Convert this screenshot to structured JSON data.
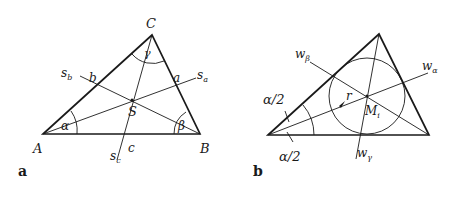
{
  "figure": {
    "panel_a": {
      "label": "a",
      "vertices": {
        "A": "A",
        "B": "B",
        "C": "C"
      },
      "sides": {
        "a": "a",
        "b": "b",
        "c": "c"
      },
      "angles": {
        "alpha": "α",
        "beta": "β",
        "gamma": "γ"
      },
      "medians": {
        "sa": "s",
        "sa_sub": "a",
        "sb": "s",
        "sb_sub": "b",
        "sc": "s",
        "sc_sub": "c"
      },
      "centroid": "S"
    },
    "panel_b": {
      "label": "b",
      "bisectors": {
        "w_alpha": "w",
        "w_alpha_sub": "α",
        "w_beta": "w",
        "w_beta_sub": "β",
        "w_gamma": "w",
        "w_gamma_sub": "γ"
      },
      "half_angle_top": "α/2",
      "half_angle_bottom": "α/2",
      "radius": "r",
      "incenter": "M",
      "incenter_sub": "i"
    }
  }
}
